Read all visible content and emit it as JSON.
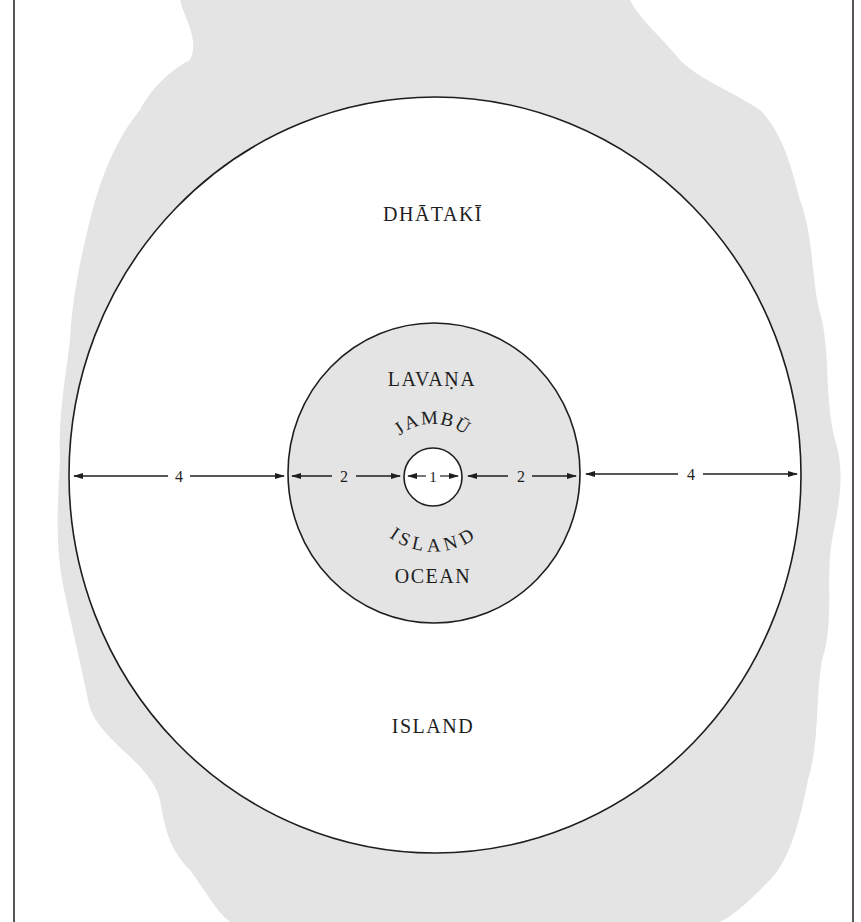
{
  "diagram": {
    "title": "",
    "colors": {
      "background": "#ffffff",
      "blob": "#e4e4e4",
      "ocean_fill": "#e4e4e4",
      "island_fill": "#ffffff",
      "line": "#1e1e1e"
    },
    "regions": {
      "outer_island": {
        "name": "DHĀTAKĪ",
        "type": "ISLAND"
      },
      "ocean": {
        "name": "LAVAṆA",
        "type": "OCEAN"
      },
      "center": {
        "name": "JAMBŪ",
        "type": "ISLAND"
      }
    },
    "measurements": {
      "left_outer": "4",
      "left_ocean": "2",
      "center": "1",
      "right_ocean": "2",
      "right_outer": "4"
    }
  }
}
